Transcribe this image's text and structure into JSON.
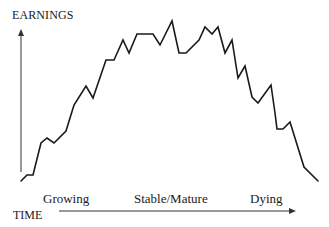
{
  "chart_data": {
    "type": "line",
    "title": "",
    "ylabel": "EARNINGS",
    "xlabel": "TIME",
    "stages": [
      "Growing",
      "Stable/Mature",
      "Dying"
    ],
    "axis_ticks": false,
    "grid": false,
    "legend": null,
    "note": "Conceptual company life-cycle curve; no numeric scale shown. Points are pixel coordinates (x right, y down) tracing the earnings line.",
    "points": [
      [
        21,
        181
      ],
      [
        27,
        175
      ],
      [
        33,
        175
      ],
      [
        41,
        143
      ],
      [
        47,
        138
      ],
      [
        54,
        143
      ],
      [
        66,
        131
      ],
      [
        74,
        105
      ],
      [
        86,
        86
      ],
      [
        93,
        98
      ],
      [
        106,
        60
      ],
      [
        114,
        60
      ],
      [
        123,
        40
      ],
      [
        129,
        53
      ],
      [
        137,
        34
      ],
      [
        153,
        34
      ],
      [
        160,
        45
      ],
      [
        172,
        21
      ],
      [
        179,
        53
      ],
      [
        186,
        53
      ],
      [
        199,
        40
      ],
      [
        205,
        27
      ],
      [
        212,
        34
      ],
      [
        218,
        27
      ],
      [
        225,
        53
      ],
      [
        232,
        40
      ],
      [
        238,
        78
      ],
      [
        245,
        66
      ],
      [
        252,
        97
      ],
      [
        258,
        103
      ],
      [
        271,
        85
      ],
      [
        275,
        113
      ],
      [
        277,
        129
      ],
      [
        283,
        129
      ],
      [
        290,
        122
      ],
      [
        304,
        167
      ],
      [
        318,
        181
      ]
    ]
  },
  "labels": {
    "y_axis_title": "EARNINGS",
    "x_axis_title": "TIME",
    "stage_growing": "Growing",
    "stage_stable": "Stable/Mature",
    "stage_dying": "Dying"
  },
  "colors": {
    "line": "#1a1a1a",
    "axis": "#333333",
    "background": "#ffffff"
  }
}
